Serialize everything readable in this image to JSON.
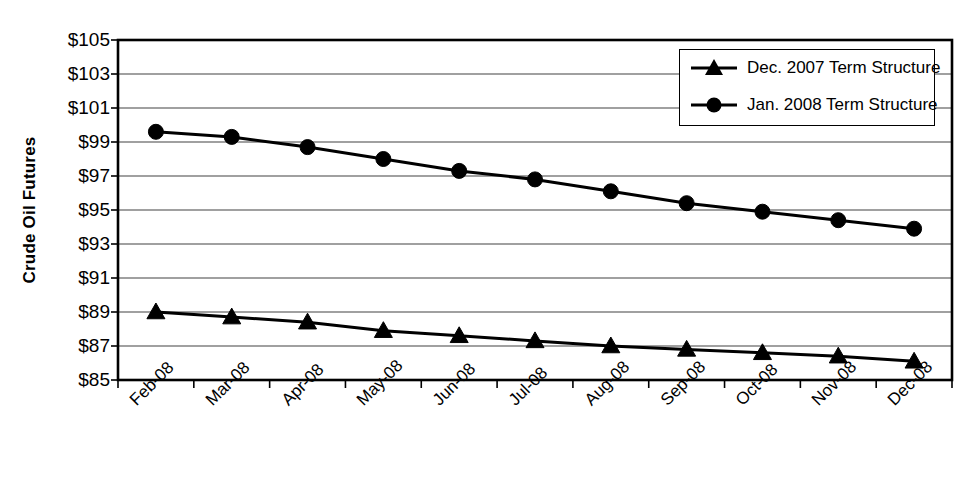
{
  "chart_data": {
    "type": "line",
    "title": "",
    "xlabel": "",
    "ylabel": "Crude Oil Futures",
    "categories": [
      "Feb-08",
      "Mar-08",
      "Apr-08",
      "May-08",
      "Jun-08",
      "Jul-08",
      "Aug-08",
      "Sep-08",
      "Oct-08",
      "Nov-08",
      "Dec-08"
    ],
    "ylim": [
      85,
      105
    ],
    "ytick_step": 2,
    "ytick_labels": [
      "$105",
      "$103",
      "$101",
      "$99",
      "$97",
      "$95",
      "$93",
      "$91",
      "$89",
      "$87",
      "$85"
    ],
    "ytick_values": [
      105,
      103,
      101,
      99,
      97,
      95,
      93,
      91,
      89,
      87,
      85
    ],
    "grid": true,
    "legend_position": "top-right",
    "series": [
      {
        "name": "Dec. 2007 Term Structure",
        "marker": "triangle",
        "color": "#000000",
        "values": [
          89.0,
          88.7,
          88.4,
          87.9,
          87.6,
          87.3,
          87.0,
          86.8,
          86.6,
          86.4,
          86.1
        ]
      },
      {
        "name": "Jan. 2008 Term Structure",
        "marker": "circle",
        "color": "#000000",
        "values": [
          99.6,
          99.3,
          98.7,
          98.0,
          97.3,
          96.8,
          96.1,
          95.4,
          94.9,
          94.4,
          93.9
        ]
      }
    ]
  },
  "legend": {
    "items": [
      {
        "label": "Dec. 2007 Term Structure",
        "marker": "triangle-marker"
      },
      {
        "label": "Jan. 2008 Term Structure",
        "marker": "circle-marker"
      }
    ]
  }
}
